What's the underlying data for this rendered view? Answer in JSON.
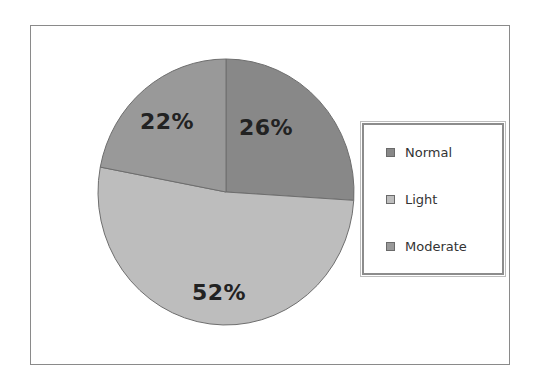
{
  "chart_data": {
    "type": "pie",
    "title": "",
    "categories": [
      "Normal",
      "Light",
      "Moderate"
    ],
    "values": [
      26,
      52,
      22
    ],
    "labels": [
      "26%",
      "52%",
      "22%"
    ],
    "colors": [
      "#888888",
      "#bdbdbd",
      "#999999"
    ],
    "start_angle_deg": 0,
    "direction": "clockwise",
    "legend_position": "right",
    "grid": false
  },
  "legend": {
    "items": [
      {
        "label": "Normal",
        "color": "#888888"
      },
      {
        "label": "Light",
        "color": "#bdbdbd"
      },
      {
        "label": "Moderate",
        "color": "#999999"
      }
    ]
  }
}
